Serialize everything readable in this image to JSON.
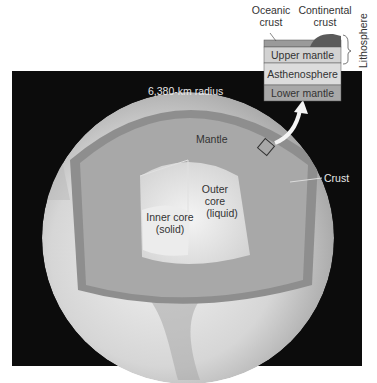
{
  "diagram": {
    "radius_label": "6,380-km radius",
    "layers": {
      "crust": "Crust",
      "mantle": "Mantle",
      "outer_core": [
        "Outer",
        "core",
        "(liquid)"
      ],
      "inner_core": [
        "Inner core",
        "(solid)"
      ]
    },
    "inset": {
      "oceanic_crust": [
        "Oceanic",
        "crust"
      ],
      "continental_crust": [
        "Continental",
        "crust"
      ],
      "upper_mantle": "Upper mantle",
      "asthenosphere": "Asthenosphere",
      "lower_mantle": "Lower mantle",
      "lithosphere": "Lithosphere"
    },
    "colors": {
      "background": "#0c0c0c",
      "globe_surface": "#d8d8d8",
      "crust_band": "#9a9a9a",
      "mantle": "#a9a9a9",
      "outer_core": "#d4d4d4",
      "inner_core": "#e6e6e6",
      "inset_crust": "#9a9a9a",
      "inset_upper_mantle": "#d2d2d2",
      "inset_asthenosphere": "#dcdcdc",
      "inset_lower_mantle": "#a8a8a8"
    }
  }
}
